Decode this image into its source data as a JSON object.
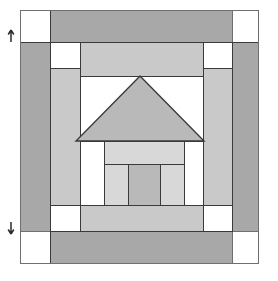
{
  "figure": {
    "name": "schoolhouse-quilt-block-diagram",
    "caption": "",
    "canvas": {
      "width": 278,
      "height": 281
    },
    "background_color": "#ffffff"
  },
  "palette": {
    "dark_fabric": "#a8a8a8",
    "medium_fabric": "#b9b9b9",
    "light_fabric": "#c9c9c9",
    "pale_fabric": "#d8d8d8",
    "background_fabric": "#ffffff",
    "seam_line": "#3a3a3a",
    "outline": "#6f6f6f",
    "marker": "#2b2b2b"
  },
  "block": {
    "label": "pieced house block",
    "bounds": {
      "x": 20,
      "y": 10,
      "width": 238,
      "height": 253
    },
    "outer_outline_color": "#6f6f6f"
  },
  "pieces": [
    {
      "name": "corner-square-top-left",
      "fabric": "background_fabric",
      "x": 20,
      "y": 10,
      "width": 30,
      "height": 32
    },
    {
      "name": "border-strip-top",
      "fabric": "dark_fabric",
      "x": 50,
      "y": 10,
      "width": 182,
      "height": 32
    },
    {
      "name": "corner-square-top-right",
      "fabric": "background_fabric",
      "x": 232,
      "y": 10,
      "width": 26,
      "height": 32
    },
    {
      "name": "border-strip-left",
      "fabric": "dark_fabric",
      "x": 20,
      "y": 42,
      "width": 30,
      "height": 189
    },
    {
      "name": "border-strip-right",
      "fabric": "dark_fabric",
      "x": 232,
      "y": 42,
      "width": 26,
      "height": 189
    },
    {
      "name": "inner-corner-square-top-left",
      "fabric": "background_fabric",
      "x": 50,
      "y": 42,
      "width": 30,
      "height": 26
    },
    {
      "name": "sky-strip-top",
      "fabric": "light_fabric",
      "x": 80,
      "y": 42,
      "width": 123,
      "height": 34
    },
    {
      "name": "inner-corner-square-top-right",
      "fabric": "background_fabric",
      "x": 203,
      "y": 42,
      "width": 29,
      "height": 26
    },
    {
      "name": "sky-strip-left",
      "fabric": "light_fabric",
      "x": 50,
      "y": 68,
      "width": 30,
      "height": 137
    },
    {
      "name": "sky-strip-right",
      "fabric": "light_fabric",
      "x": 203,
      "y": 68,
      "width": 29,
      "height": 137
    },
    {
      "name": "sky-background-under-roof",
      "fabric": "background_fabric",
      "x": 80,
      "y": 76,
      "width": 123,
      "height": 65
    },
    {
      "name": "roof-triangle",
      "fabric": "medium_fabric",
      "points": "140,76 204,141 76,141"
    },
    {
      "name": "house-lintel-bar",
      "fabric": "pale_fabric",
      "x": 104,
      "y": 141,
      "width": 80,
      "height": 23
    },
    {
      "name": "house-panel-left",
      "fabric": "pale_fabric",
      "x": 104,
      "y": 164,
      "width": 24,
      "height": 41
    },
    {
      "name": "house-door",
      "fabric": "medium_fabric",
      "x": 128,
      "y": 164,
      "width": 32,
      "height": 41
    },
    {
      "name": "house-panel-right",
      "fabric": "pale_fabric",
      "x": 160,
      "y": 164,
      "width": 24,
      "height": 41
    },
    {
      "name": "sky-strip-bottom",
      "fabric": "light_fabric",
      "x": 80,
      "y": 205,
      "width": 123,
      "height": 26
    },
    {
      "name": "inner-corner-square-bottom-left",
      "fabric": "background_fabric",
      "x": 50,
      "y": 205,
      "width": 30,
      "height": 26
    },
    {
      "name": "inner-corner-square-bottom-right",
      "fabric": "background_fabric",
      "x": 203,
      "y": 205,
      "width": 29,
      "height": 26
    },
    {
      "name": "corner-square-bottom-left",
      "fabric": "background_fabric",
      "x": 20,
      "y": 231,
      "width": 30,
      "height": 32
    },
    {
      "name": "border-strip-bottom",
      "fabric": "dark_fabric",
      "x": 50,
      "y": 231,
      "width": 182,
      "height": 32
    },
    {
      "name": "corner-square-bottom-right",
      "fabric": "background_fabric",
      "x": 232,
      "y": 231,
      "width": 26,
      "height": 32
    }
  ],
  "markers": [
    {
      "name": "measurement-arrow-top",
      "x": 11,
      "y": 35,
      "orientation": "up"
    },
    {
      "name": "measurement-arrow-bottom",
      "x": 11,
      "y": 228,
      "orientation": "down"
    }
  ]
}
